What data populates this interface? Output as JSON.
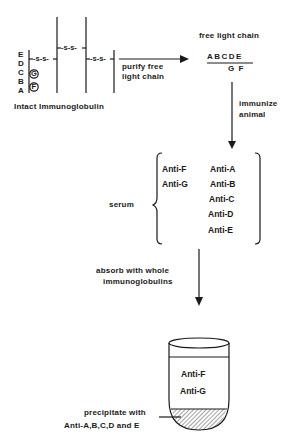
{
  "immunoglobulin": {
    "caption": "Intact Immunoglobulin",
    "domain_letters": [
      "E",
      "D",
      "C",
      "B",
      "A"
    ],
    "circled_letters": [
      "G",
      "F"
    ],
    "disulfide_label": "-s-s-"
  },
  "step1": {
    "label_line1": "purify free",
    "label_line2": "light chain"
  },
  "free_light_chain": {
    "title": "free light chain",
    "top": "ABCDE",
    "bottom": "G F"
  },
  "step2": {
    "label_line1": "immunize",
    "label_line2": "animal"
  },
  "serum": {
    "label": "serum",
    "left_column": [
      "Anti-F",
      "Anti-G"
    ],
    "right_column": [
      "Anti-A",
      "Anti-B",
      "Anti-C",
      "Anti-D",
      "Anti-E"
    ]
  },
  "step3": {
    "label_line1": "absorb with whole",
    "label_line2": "immunoglobulins"
  },
  "tube": {
    "supernatant": [
      "Anti-F",
      "Anti-G"
    ],
    "precipitate_line1": "precipitate with",
    "precipitate_line2": "Anti-A,B,C,D and E"
  },
  "colors": {
    "ink": "#1a1a1a",
    "background": "#ffffff"
  }
}
